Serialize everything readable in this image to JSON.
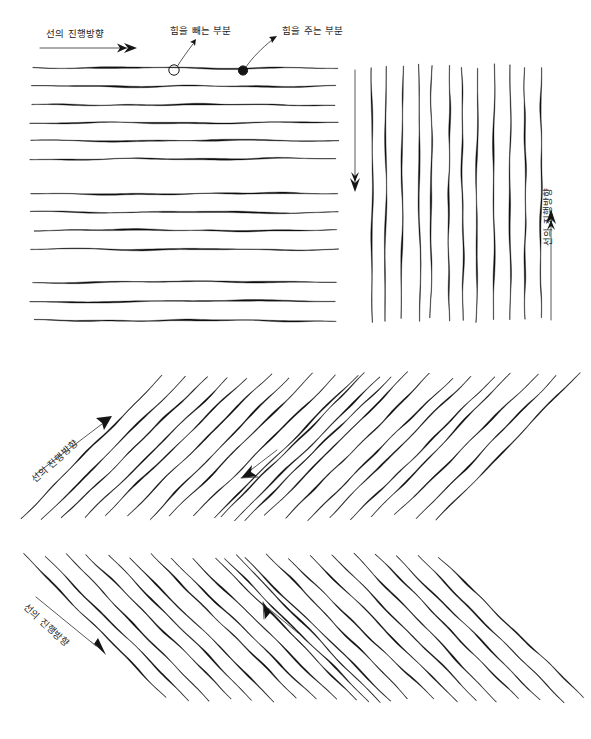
{
  "document": {
    "title": "선 긋기 연습 도해",
    "language": "ko",
    "ink_color": "#101010",
    "paper_color": "#ffffff"
  },
  "annotations": {
    "direction_label": "선의 진행방향",
    "release_label": "힘을 빼는 부분",
    "apply_label": "힘을 주는 부분"
  },
  "panels": [
    {
      "id": "horizontal",
      "name": "가로선 연습",
      "orientation": "horizontal",
      "direction_label": "선의 진행방향",
      "direction_arrow": "right",
      "groups": [
        6,
        4,
        3
      ],
      "line_count": 13,
      "callouts": [
        {
          "type": "release",
          "label": "힘을 빼는 부분",
          "filled": false
        },
        {
          "type": "apply",
          "label": "힘을 주는 부분",
          "filled": true
        }
      ]
    },
    {
      "id": "vertical",
      "name": "세로선 연습",
      "orientation": "vertical",
      "direction_label": "선의 진행방향",
      "direction_arrow": "up",
      "secondary_arrow": "down",
      "line_count": 12
    },
    {
      "id": "diagonal-up",
      "name": "우상향 사선 연습",
      "orientation": "diagonal-up",
      "direction_label": "선의 진행방향",
      "direction_arrow": "up-right",
      "secondary_arrow": "down-left",
      "line_count": 22
    },
    {
      "id": "diagonal-down",
      "name": "우하향 사선 연습",
      "orientation": "diagonal-down",
      "direction_label": "선의 진행방향",
      "direction_arrow": "down-right",
      "secondary_arrow": "up-left",
      "line_count": 22
    }
  ]
}
